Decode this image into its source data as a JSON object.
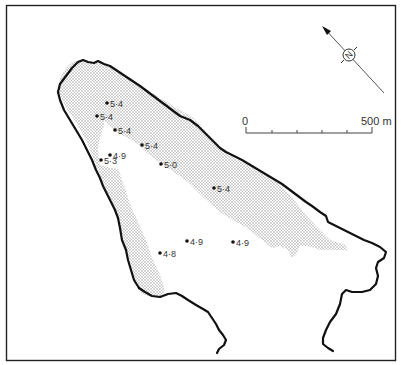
{
  "map": {
    "title": "",
    "scale_bar": {
      "start_label": "0",
      "end_label": "500 m",
      "divisions": 5
    },
    "north_arrow": {
      "icon": "north-arrow-icon",
      "symbol": "N"
    },
    "legend_shading": "stippled area",
    "sample_points": [
      {
        "label": "5·4"
      },
      {
        "label": "5·4"
      },
      {
        "label": "5·4"
      },
      {
        "label": "4·9"
      },
      {
        "label": "5·3"
      },
      {
        "label": "5·4"
      },
      {
        "label": "5·0"
      },
      {
        "label": "5·4"
      },
      {
        "label": "4·9"
      },
      {
        "label": "4·9"
      },
      {
        "label": "4·8"
      }
    ],
    "colors": {
      "outline": "#111111",
      "stipple": "#9a9a9a",
      "frame": "#222222",
      "text": "#333333"
    }
  }
}
